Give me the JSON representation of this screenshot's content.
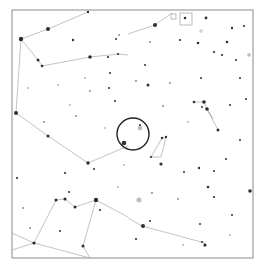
{
  "map": {
    "type": "star-chart",
    "background": "#ffffff",
    "frame": {
      "x": 12,
      "y": 10,
      "w": 241,
      "h": 248,
      "color": "#8c8c8c"
    },
    "line_color": "#b4b4b4",
    "star_color": "#1a1a1a",
    "fov_circle": {
      "cx": 133,
      "cy": 134,
      "r": 16,
      "color": "#222222"
    },
    "constellation_lines": [
      [
        [
          21,
          39
        ],
        [
          48,
          29
        ],
        [
          88,
          12
        ]
      ],
      [
        [
          21,
          39
        ],
        [
          16,
          113
        ]
      ],
      [
        [
          21,
          39
        ],
        [
          38,
          60
        ],
        [
          42,
          66
        ],
        [
          90,
          57
        ],
        [
          118,
          54
        ],
        [
          128,
          55
        ]
      ],
      [
        [
          128,
          34
        ],
        [
          155,
          25
        ],
        [
          172,
          13
        ]
      ],
      [
        [
          16,
          113
        ],
        [
          48,
          136
        ],
        [
          88,
          163
        ],
        [
          128,
          146
        ]
      ],
      [
        [
          56,
          200
        ],
        [
          65,
          199
        ],
        [
          75,
          207
        ],
        [
          96,
          200
        ],
        [
          128,
          217
        ]
      ],
      [
        [
          56,
          200
        ],
        [
          34,
          243
        ]
      ],
      [
        [
          96,
          200
        ],
        [
          83,
          246
        ],
        [
          90,
          258
        ]
      ],
      [
        [
          12,
          233
        ],
        [
          34,
          243
        ],
        [
          90,
          258
        ]
      ],
      [
        [
          12,
          250
        ],
        [
          34,
          243
        ]
      ],
      [
        [
          162,
          138
        ],
        [
          166,
          137
        ],
        [
          161,
          157
        ],
        [
          151,
          157
        ],
        [
          162,
          138
        ]
      ],
      [
        [
          194,
          102
        ],
        [
          204,
          102
        ],
        [
          207,
          109
        ],
        [
          213,
          119
        ],
        [
          207,
          109
        ],
        [
          218,
          130
        ]
      ],
      [
        [
          128,
          218
        ],
        [
          142,
          226
        ],
        [
          205,
          243
        ],
        [
          204,
          247
        ]
      ]
    ],
    "stars": [
      {
        "x": 21,
        "y": 39,
        "r": 2.2
      },
      {
        "x": 48,
        "y": 29,
        "r": 2.0
      },
      {
        "x": 88,
        "y": 12,
        "r": 1.2
      },
      {
        "x": 38,
        "y": 60,
        "r": 1.5
      },
      {
        "x": 42,
        "y": 66,
        "r": 1.3
      },
      {
        "x": 90,
        "y": 57,
        "r": 1.8
      },
      {
        "x": 118,
        "y": 54,
        "r": 1.1
      },
      {
        "x": 16,
        "y": 113,
        "r": 2.0
      },
      {
        "x": 48,
        "y": 136,
        "r": 1.5
      },
      {
        "x": 88,
        "y": 163,
        "r": 1.7
      },
      {
        "x": 155,
        "y": 25,
        "r": 2.0
      },
      {
        "x": 185,
        "y": 18,
        "r": 1.3
      },
      {
        "x": 206,
        "y": 18,
        "r": 1.4
      },
      {
        "x": 232,
        "y": 28,
        "r": 1.2
      },
      {
        "x": 227,
        "y": 42,
        "r": 1.3
      },
      {
        "x": 244,
        "y": 26,
        "r": 1.1
      },
      {
        "x": 180,
        "y": 40,
        "r": 1.1
      },
      {
        "x": 198,
        "y": 43,
        "r": 1.3
      },
      {
        "x": 73,
        "y": 40,
        "r": 1.2
      },
      {
        "x": 108,
        "y": 57,
        "r": 1.1
      },
      {
        "x": 119,
        "y": 35,
        "r": 0.9
      },
      {
        "x": 148,
        "y": 85,
        "r": 1.5
      },
      {
        "x": 124,
        "y": 143,
        "r": 2.3
      },
      {
        "x": 162,
        "y": 138,
        "r": 1.2
      },
      {
        "x": 166,
        "y": 137,
        "r": 1.2
      },
      {
        "x": 151,
        "y": 157,
        "r": 1.1
      },
      {
        "x": 161,
        "y": 164,
        "r": 1.6
      },
      {
        "x": 194,
        "y": 102,
        "r": 1.3
      },
      {
        "x": 204,
        "y": 102,
        "r": 1.8
      },
      {
        "x": 207,
        "y": 109,
        "r": 1.8
      },
      {
        "x": 218,
        "y": 130,
        "r": 1.5
      },
      {
        "x": 202,
        "y": 107,
        "r": 1.0
      },
      {
        "x": 230,
        "y": 105,
        "r": 1.0
      },
      {
        "x": 250,
        "y": 191,
        "r": 1.8
      },
      {
        "x": 208,
        "y": 187,
        "r": 1.3
      },
      {
        "x": 214,
        "y": 197,
        "r": 1.1
      },
      {
        "x": 56,
        "y": 200,
        "r": 1.5
      },
      {
        "x": 65,
        "y": 199,
        "r": 1.6
      },
      {
        "x": 75,
        "y": 207,
        "r": 1.5
      },
      {
        "x": 96,
        "y": 200,
        "r": 2.2
      },
      {
        "x": 69,
        "y": 192,
        "r": 1.0
      },
      {
        "x": 34,
        "y": 243,
        "r": 1.6
      },
      {
        "x": 83,
        "y": 246,
        "r": 1.5
      },
      {
        "x": 143,
        "y": 226,
        "r": 2.0
      },
      {
        "x": 205,
        "y": 245,
        "r": 1.6
      },
      {
        "x": 136,
        "y": 239,
        "r": 1.1
      },
      {
        "x": 202,
        "y": 242,
        "r": 1.0
      },
      {
        "x": 150,
        "y": 221,
        "r": 1.0
      },
      {
        "x": 200,
        "y": 224,
        "r": 1.0
      },
      {
        "x": 17,
        "y": 178,
        "r": 1.1
      },
      {
        "x": 65,
        "y": 173,
        "r": 1.1
      },
      {
        "x": 100,
        "y": 210,
        "r": 1.1
      },
      {
        "x": 94,
        "y": 169,
        "r": 1.0
      },
      {
        "x": 60,
        "y": 231,
        "r": 1.0
      },
      {
        "x": 199,
        "y": 168,
        "r": 1.2
      },
      {
        "x": 214,
        "y": 171,
        "r": 1.0
      },
      {
        "x": 232,
        "y": 215,
        "r": 1.0
      },
      {
        "x": 214,
        "y": 52,
        "r": 1.1
      },
      {
        "x": 222,
        "y": 55,
        "r": 1.1
      },
      {
        "x": 201,
        "y": 78,
        "r": 1.0
      },
      {
        "x": 116,
        "y": 39,
        "r": 1.0
      },
      {
        "x": 110,
        "y": 73,
        "r": 1.0
      },
      {
        "x": 109,
        "y": 88,
        "r": 1.0
      },
      {
        "x": 115,
        "y": 101,
        "r": 1.0
      },
      {
        "x": 140,
        "y": 125,
        "r": 1.0
      },
      {
        "x": 145,
        "y": 65,
        "r": 1.0
      },
      {
        "x": 236,
        "y": 60,
        "r": 1.0
      },
      {
        "x": 240,
        "y": 78,
        "r": 1.0
      },
      {
        "x": 246,
        "y": 99,
        "r": 1.0
      },
      {
        "x": 240,
        "y": 140,
        "r": 1.0
      },
      {
        "x": 184,
        "y": 172,
        "r": 1.0
      },
      {
        "x": 226,
        "y": 159,
        "r": 1.0
      },
      {
        "x": 76,
        "y": 116,
        "r": 0.9
      },
      {
        "x": 44,
        "y": 122,
        "r": 0.9
      },
      {
        "x": 90,
        "y": 91,
        "r": 0.9
      },
      {
        "x": 23,
        "y": 208,
        "r": 0.9
      },
      {
        "x": 30,
        "y": 228,
        "r": 0.9
      },
      {
        "x": 163,
        "y": 106,
        "r": 0.9
      },
      {
        "x": 152,
        "y": 193,
        "r": 0.9
      },
      {
        "x": 178,
        "y": 199,
        "r": 0.9
      },
      {
        "x": 170,
        "y": 83,
        "r": 0.9
      },
      {
        "x": 136,
        "y": 81,
        "r": 0.9
      },
      {
        "x": 150,
        "y": 42,
        "r": 0.9
      },
      {
        "x": 58,
        "y": 85,
        "r": 0.8
      },
      {
        "x": 70,
        "y": 105,
        "r": 0.8
      },
      {
        "x": 28,
        "y": 88,
        "r": 0.8
      },
      {
        "x": 105,
        "y": 128,
        "r": 0.8
      },
      {
        "x": 85,
        "y": 78,
        "r": 0.8
      },
      {
        "x": 124,
        "y": 165,
        "r": 0.8
      },
      {
        "x": 188,
        "y": 122,
        "r": 0.8
      },
      {
        "x": 230,
        "y": 235,
        "r": 0.8
      },
      {
        "x": 183,
        "y": 245,
        "r": 0.8
      },
      {
        "x": 118,
        "y": 187,
        "r": 0.8
      }
    ],
    "deep_sky_objects": [
      {
        "x": 140,
        "y": 128,
        "r": 2.3,
        "color": "#bdbdbd"
      },
      {
        "x": 139,
        "y": 200,
        "r": 2.5,
        "color": "#bdbdbd"
      },
      {
        "x": 201,
        "y": 31,
        "r": 2.0,
        "color": "#d8d8d8"
      },
      {
        "x": 249,
        "y": 55,
        "r": 1.8,
        "color": "#bdbdbd"
      }
    ],
    "boxes": [
      {
        "x": 180,
        "y": 13,
        "w": 12,
        "h": 12
      },
      {
        "x": 171,
        "y": 14,
        "w": 5,
        "h": 5
      }
    ]
  }
}
